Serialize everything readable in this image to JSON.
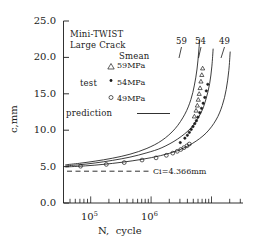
{
  "chart_data": {
    "type": "line",
    "title": "",
    "xlabel": "N, cycle",
    "ylabel": "c,mm",
    "xscale": "log",
    "xlim": [
      40000,
      4000000
    ],
    "ylim": [
      0.0,
      25.0
    ],
    "yticks": [
      "0.0",
      "5.0",
      "10.0",
      "15.0",
      "20.0",
      "25.0"
    ],
    "ytick_values": [
      0.0,
      5.0,
      10.0,
      15.0,
      20.0,
      25.0
    ],
    "xticks": [
      "10",
      "10"
    ],
    "xtick_exponents": [
      "5",
      "6"
    ],
    "xtick_values": [
      100000,
      1000000
    ],
    "grid": false,
    "legend_position": "upper-left-inside",
    "annotations": {
      "sample_line1": "Mini-TWIST",
      "sample_line2": "Large Crack",
      "reference_line_label": "Ci=4.366mm",
      "reference_line_value": 4.366,
      "curve_end_labels": [
        "59",
        "54",
        "49"
      ]
    },
    "legend": {
      "group_header": "Smean",
      "test_label": "test",
      "prediction_label": "prediction",
      "entries": [
        {
          "marker": "triangle-up-open",
          "label": "59MPa"
        },
        {
          "marker": "dot-filled",
          "label": "54MPa"
        },
        {
          "marker": "circle-open",
          "label": "49MPa"
        }
      ]
    },
    "series": [
      {
        "name": "59MPa prediction",
        "kind": "prediction-curve",
        "label": "59",
        "x": [
          42000,
          60000,
          90000,
          140000,
          220000,
          340000,
          500000,
          700000,
          900000,
          1050000,
          1150000,
          1230000,
          1280000,
          1320000
        ],
        "y": [
          5.25,
          5.45,
          5.75,
          6.15,
          6.7,
          7.5,
          8.6,
          10.2,
          12.2,
          14.2,
          16.2,
          18.4,
          20.6,
          22.6
        ]
      },
      {
        "name": "54MPa prediction",
        "kind": "prediction-curve",
        "label": "54",
        "x": [
          42000,
          60000,
          90000,
          140000,
          220000,
          340000,
          500000,
          750000,
          1050000,
          1350000,
          1550000,
          1700000,
          1800000,
          1860000
        ],
        "y": [
          5.1,
          5.25,
          5.5,
          5.85,
          6.3,
          6.9,
          7.6,
          8.8,
          10.3,
          12.3,
          14.3,
          16.4,
          18.8,
          21.2
        ]
      },
      {
        "name": "49MPa prediction",
        "kind": "prediction-curve",
        "label": "49",
        "x": [
          42000,
          70000,
          110000,
          180000,
          300000,
          480000,
          750000,
          1100000,
          1550000,
          2000000,
          2350000,
          2600000,
          2780000,
          2880000
        ],
        "y": [
          4.95,
          5.1,
          5.3,
          5.6,
          6.0,
          6.5,
          7.2,
          8.2,
          9.6,
          11.4,
          13.4,
          15.6,
          18.2,
          20.8
        ]
      },
      {
        "name": "59MPa",
        "kind": "test-data",
        "marker": "triangle-up-open",
        "x": [
          1150000,
          1200000,
          1240000,
          1270000,
          1300000,
          1330000,
          1360000,
          1390000,
          1420000
        ],
        "y": [
          11.9,
          12.7,
          13.4,
          14.2,
          15.0,
          15.8,
          16.7,
          17.6,
          18.5
        ]
      },
      {
        "name": "54MPa",
        "kind": "test-data",
        "marker": "dot-filled",
        "x": [
          800000,
          900000,
          960000,
          1010000,
          1060000,
          1110000,
          1160000,
          1210000,
          1260000,
          1320000,
          1380000,
          1440000,
          1500000,
          1560000,
          1620000
        ],
        "y": [
          8.3,
          8.9,
          9.3,
          9.7,
          10.1,
          10.5,
          10.9,
          11.3,
          11.8,
          12.4,
          13.0,
          13.7,
          14.5,
          15.4,
          16.3
        ]
      },
      {
        "name": "49MPa",
        "kind": "test-data",
        "marker": "circle-open",
        "x": [
          62000,
          120000,
          190000,
          300000,
          430000,
          560000,
          660000,
          740000,
          810000,
          880000,
          950000,
          1010000
        ],
        "y": [
          5.05,
          5.3,
          5.55,
          5.9,
          6.2,
          6.55,
          6.85,
          7.1,
          7.35,
          7.6,
          7.85,
          8.1
        ]
      }
    ]
  },
  "axes": {
    "ylabel": "c,mm",
    "xlabel_main": "N,",
    "xlabel_unit": "cycle",
    "ytick_0": "0.0",
    "ytick_1": "5.0",
    "ytick_2": "10.0",
    "ytick_3": "15.0",
    "ytick_4": "20.0",
    "ytick_5": "25.0",
    "xtick_0_base": "10",
    "xtick_0_exp": "5",
    "xtick_1_base": "10",
    "xtick_1_exp": "6"
  },
  "legend": {
    "line1": "Mini-TWIST",
    "line2": "Large Crack",
    "smean": "Smean",
    "test": "test",
    "prediction": "prediction",
    "e59": "59MPa",
    "e54": "54MPa",
    "e49": "49MPa"
  },
  "labels": {
    "curve59": "59",
    "curve54": "54",
    "curve49": "49",
    "ci": "Ci=4.366mm"
  },
  "colors": {
    "ink": "#1a1a1a",
    "background": "#ffffff"
  }
}
